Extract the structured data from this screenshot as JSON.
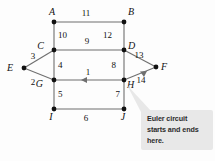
{
  "diagram": {
    "background_color": "#fdfdfd",
    "edge_color": "#6f6f6f",
    "node_color": "#111111",
    "callout_color": "#e8e8e8",
    "nodes": [
      {
        "id": "A",
        "label": "A",
        "x": 54,
        "y": 22,
        "label_x": 49,
        "label_y": 15
      },
      {
        "id": "B",
        "label": "B",
        "x": 124,
        "y": 22,
        "label_x": 128,
        "label_y": 15
      },
      {
        "id": "C",
        "label": "C",
        "x": 54,
        "y": 50,
        "label_x": 44,
        "label_y": 49
      },
      {
        "id": "D",
        "label": "D",
        "x": 124,
        "y": 50,
        "label_x": 128,
        "label_y": 49
      },
      {
        "id": "E",
        "label": "E",
        "x": 24,
        "y": 68,
        "label_x": 13,
        "label_y": 71
      },
      {
        "id": "F",
        "label": "F",
        "x": 156,
        "y": 67,
        "label_x": 161,
        "label_y": 70
      },
      {
        "id": "G",
        "label": "G",
        "x": 54,
        "y": 80,
        "label_x": 43,
        "label_y": 87
      },
      {
        "id": "H",
        "label": "H",
        "x": 124,
        "y": 80,
        "label_x": 127,
        "label_y": 88
      },
      {
        "id": "I",
        "label": "I",
        "x": 54,
        "y": 109,
        "label_x": 51,
        "label_y": 120
      },
      {
        "id": "J",
        "label": "J",
        "x": 124,
        "y": 109,
        "label_x": 121,
        "label_y": 120
      }
    ],
    "edges": [
      {
        "id": "e11",
        "label": "11",
        "from": "A",
        "to": "B",
        "label_x": 86,
        "label_y": 16,
        "arrow": "none"
      },
      {
        "id": "e10",
        "label": "10",
        "from": "A",
        "to": "C",
        "label_x": 58,
        "label_y": 38,
        "arrow": "none"
      },
      {
        "id": "e12",
        "label": "12",
        "from": "B",
        "to": "D",
        "label_x": 112,
        "label_y": 38,
        "arrow": "none"
      },
      {
        "id": "e9",
        "label": "9",
        "from": "C",
        "to": "D",
        "label_x": 87,
        "label_y": 44,
        "arrow": "none"
      },
      {
        "id": "e3",
        "label": "3",
        "from": "E",
        "to": "C",
        "label_x": 33,
        "label_y": 59,
        "arrow": "none"
      },
      {
        "id": "e2",
        "label": "2",
        "from": "E",
        "to": "G",
        "label_x": 33,
        "label_y": 85,
        "arrow": "none"
      },
      {
        "id": "e4",
        "label": "4",
        "from": "C",
        "to": "G",
        "label_x": 58,
        "label_y": 68,
        "arrow": "none"
      },
      {
        "id": "e8",
        "label": "8",
        "from": "D",
        "to": "H",
        "label_x": 112,
        "label_y": 68,
        "arrow": "none"
      },
      {
        "id": "e13",
        "label": "13",
        "from": "D",
        "to": "F",
        "label_x": 139,
        "label_y": 58,
        "arrow": "none"
      },
      {
        "id": "e1",
        "label": "1",
        "from": "H",
        "to": "G",
        "label_x": 88,
        "label_y": 75,
        "arrow": "to-left"
      },
      {
        "id": "e14",
        "label": "14",
        "from": "H",
        "to": "F",
        "label_x": 141,
        "label_y": 82,
        "arrow": "to-upright"
      },
      {
        "id": "e5",
        "label": "5",
        "from": "G",
        "to": "I",
        "label_x": 58,
        "label_y": 97,
        "arrow": "none"
      },
      {
        "id": "e7",
        "label": "7",
        "from": "H",
        "to": "J",
        "label_x": 116,
        "label_y": 97,
        "arrow": "none"
      },
      {
        "id": "e6",
        "label": "6",
        "from": "I",
        "to": "J",
        "label_x": 86,
        "label_y": 121,
        "arrow": "none"
      }
    ],
    "callout": {
      "lines": [
        "Euler circuit",
        "starts and ends",
        "here."
      ],
      "box_x": 141,
      "box_y": 110,
      "box_w": 72,
      "box_h": 40,
      "tail_from_x": 127,
      "tail_from_y": 85,
      "anchor_node": "H"
    }
  }
}
